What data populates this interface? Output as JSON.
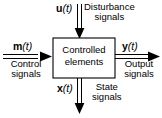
{
  "diagram": {
    "background_color": "#ffffff",
    "line_color": "#000000",
    "block": {
      "name": "controlled-elements-block",
      "line1": "Controlled",
      "line2": "elements",
      "fill": "#ffffff",
      "stroke": "#000000"
    },
    "signals": [
      {
        "id": "disturbance",
        "symbol": "u",
        "argument": "(t)",
        "caption_line1": "Disturbance",
        "caption_line2": "signals",
        "direction": "down",
        "into_block": true,
        "arrow_style": "double-line"
      },
      {
        "id": "control",
        "symbol": "m",
        "argument": "(t)",
        "caption_line1": "Control",
        "caption_line2": "signals",
        "direction": "right",
        "into_block": true,
        "arrow_style": "double-line"
      },
      {
        "id": "output",
        "symbol": "y",
        "argument": "(t)",
        "caption_line1": "Output",
        "caption_line2": "signals",
        "direction": "right",
        "into_block": false,
        "arrow_style": "double-line"
      },
      {
        "id": "state",
        "symbol": "x",
        "argument": "(t)",
        "caption_line1": "State",
        "caption_line2": "signals",
        "direction": "down",
        "into_block": false,
        "arrow_style": "double-line"
      }
    ]
  }
}
